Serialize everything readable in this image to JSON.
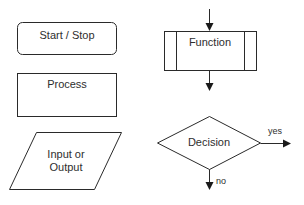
{
  "diagram": {
    "type": "flowchart-legend",
    "colors": {
      "stroke": "#2a2a2a",
      "fill": "#ffffff",
      "text": "#2e2e2e"
    },
    "shapes": [
      {
        "id": "start-stop",
        "kind": "rounded-rectangle",
        "label": "Start / Stop"
      },
      {
        "id": "process",
        "kind": "rectangle",
        "label": "Process"
      },
      {
        "id": "input-output",
        "kind": "parallelogram",
        "label_line1": "Input or",
        "label_line2": "Output"
      },
      {
        "id": "function",
        "kind": "predefined-process",
        "label": "Function"
      },
      {
        "id": "decision",
        "kind": "diamond",
        "label": "Decision"
      }
    ],
    "edges": [
      {
        "id": "function-in",
        "to": "function"
      },
      {
        "id": "function-out",
        "from": "function"
      },
      {
        "id": "decision-yes",
        "from": "decision",
        "label": "yes"
      },
      {
        "id": "decision-no",
        "from": "decision",
        "label": "no"
      }
    ]
  }
}
